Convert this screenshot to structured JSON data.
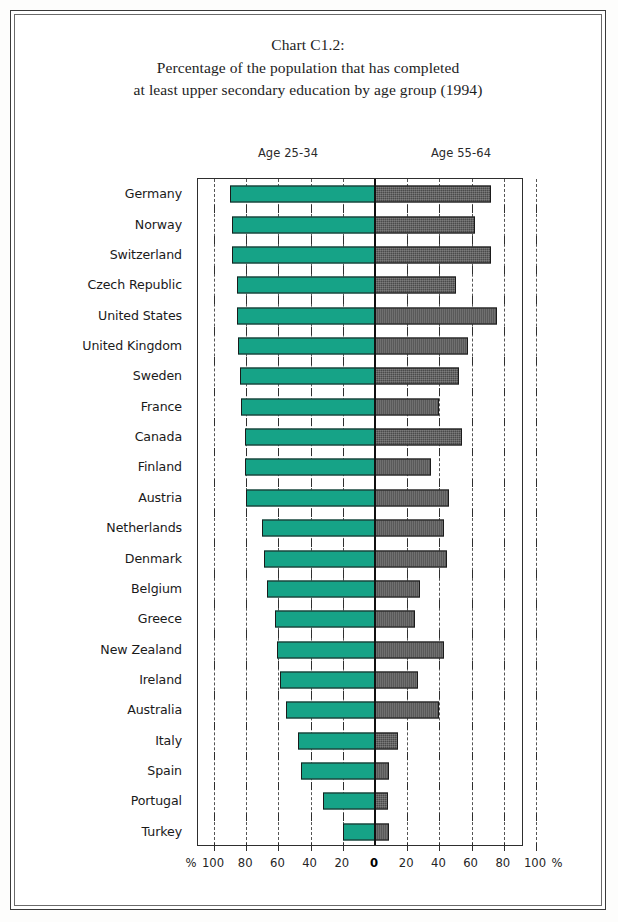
{
  "chart_data": {
    "type": "bar",
    "subtype": "diverging-horizontal-butterfly",
    "title": "Chart C1.2:",
    "subtitle_line1": "Percentage of the population that has completed",
    "subtitle_line2": "at least upper secondary education by age group (1994)",
    "title_lines": [
      "Chart C1.2:",
      "Percentage of the population that has completed",
      "at least upper secondary education by age group (1994)"
    ],
    "xlabel": "%",
    "ylabel": "",
    "unit": "%",
    "xlim": [
      -100,
      100
    ],
    "xticks": [
      -100,
      -80,
      -60,
      -40,
      -20,
      0,
      20,
      40,
      60,
      80,
      100
    ],
    "xtick_labels": [
      "100",
      "80",
      "60",
      "40",
      "20",
      "0",
      "20",
      "40",
      "60",
      "80",
      "100"
    ],
    "axis_end_label_left": "%",
    "axis_end_label_right": "%",
    "grid": "dashed-vertical",
    "legend_position": "above-plot",
    "left_axis_caption": "Age 25-34",
    "right_axis_caption": "Age 55-64",
    "categories": [
      "Germany",
      "Norway",
      "Switzerland",
      "Czech Republic",
      "United States",
      "United Kingdom",
      "Sweden",
      "France",
      "Canada",
      "Finland",
      "Austria",
      "Netherlands",
      "Denmark",
      "Belgium",
      "Greece",
      "New Zealand",
      "Ireland",
      "Australia",
      "Italy",
      "Spain",
      "Portugal",
      "Turkey"
    ],
    "series": [
      {
        "name": "Age 25-34",
        "direction": "left",
        "color": "#16a387",
        "values": [
          90,
          89,
          89,
          86,
          86,
          85,
          84,
          83,
          81,
          81,
          80,
          70,
          69,
          67,
          62,
          61,
          59,
          55,
          48,
          46,
          32,
          20
        ]
      },
      {
        "name": "Age 55-64",
        "direction": "right",
        "color": "#4a4a4a",
        "values": [
          72,
          62,
          72,
          50,
          76,
          58,
          52,
          40,
          54,
          35,
          46,
          43,
          45,
          28,
          25,
          43,
          27,
          40,
          14,
          9,
          8,
          9
        ]
      }
    ]
  },
  "colors": {
    "bar_left": "#16a387",
    "bar_right": "#4a4a4a",
    "axis": "#2e2e2e",
    "zero_axis": "#111111",
    "page_background": "#ffffff",
    "text": "#1a1a1a"
  }
}
